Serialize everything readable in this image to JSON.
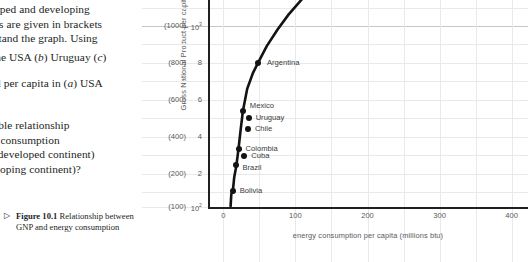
{
  "text_column": {
    "paragraphs": [
      "oped and developing<br>es are given in brackets<br>stand the graph. Using",
      "the USA (<i>b</i>) Uruguay (<i>c</i>)",
      "ed per capita in (<i>a</i>) USA",
      "ssible relationship<br>gy consumption<br> (a developed continent)<br>veloping continent)?"
    ],
    "caption": {
      "marker": "▷",
      "label": "Figure 10.1",
      "text": "Relationship between GNP and energy consumption"
    }
  },
  "chart_data": {
    "type": "scatter",
    "title": "",
    "xlabel": "energy consumption per capita (millions btu)",
    "ylabel": "Gross National Product per capita",
    "xlim": [
      -20,
      420
    ],
    "ylim": [
      0,
      11.6
    ],
    "grid": true,
    "legend_position": "none",
    "x_ticks": [
      "0",
      "100",
      "200",
      "300",
      "400"
    ],
    "x_tick_values": [
      0,
      100,
      200,
      300,
      400
    ],
    "y_ticks_bracketed": [
      "(1000)",
      "(800)",
      "(600)",
      "(400)",
      "(200)",
      "(100)"
    ],
    "y_ticks_plain": [
      "10",
      "8",
      "6",
      "4",
      "2",
      "10"
    ],
    "y_ticks_plain_sup": [
      "3",
      "",
      "",
      "",
      "",
      "2"
    ],
    "y_tick_values": [
      10,
      8,
      6,
      4,
      2,
      0.2
    ],
    "points": [
      {
        "name": "Argentina",
        "x": 48,
        "y": 8.0,
        "label_dx": 9,
        "label_dy": 0
      },
      {
        "name": "Mexico",
        "x": 27,
        "y": 5.4,
        "label_dx": 7,
        "label_dy": -5
      },
      {
        "name": "Uruguay",
        "x": 35,
        "y": 5.0,
        "label_dx": 7,
        "label_dy": 0
      },
      {
        "name": "Chile",
        "x": 34,
        "y": 4.4,
        "label_dx": 7,
        "label_dy": 0
      },
      {
        "name": "Colombia",
        "x": 21,
        "y": 3.35,
        "label_dx": 7,
        "label_dy": 0
      },
      {
        "name": "Cuba",
        "x": 29,
        "y": 2.95,
        "label_dx": 7,
        "label_dy": 0
      },
      {
        "name": "Brazil",
        "x": 18,
        "y": 2.45,
        "label_dx": 6,
        "label_dy": 3
      },
      {
        "name": "Bolivia",
        "x": 13,
        "y": 1.05,
        "label_dx": 7,
        "label_dy": 0
      }
    ],
    "curve": "logarithmic trend rising steeply from origin then flattening toward upper right"
  }
}
